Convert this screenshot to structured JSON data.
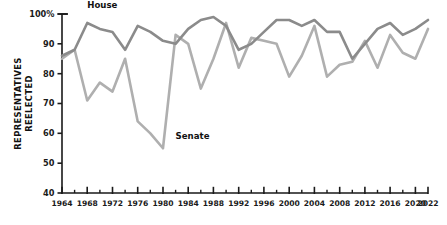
{
  "chart_data": {
    "type": "line",
    "title": "",
    "xlabel": "",
    "ylabel": "REPRESENTATIVES REELECTED",
    "ylabel_lines": [
      "REPRESENTATIVES",
      "REELECTED"
    ],
    "xlim": [
      1964,
      2022
    ],
    "ylim": [
      40,
      100
    ],
    "grid": false,
    "legend": "inline-labels",
    "y_ticks": [
      40,
      50,
      60,
      70,
      80,
      90,
      100
    ],
    "y_ticklabels": [
      "40",
      "50",
      "60",
      "70",
      "80",
      "90",
      "100%"
    ],
    "x_ticks": [
      1964,
      1968,
      1972,
      1976,
      1980,
      1984,
      1988,
      1992,
      1996,
      2000,
      2004,
      2008,
      2012,
      2016,
      2020,
      2022
    ],
    "x_ticklabels": [
      "1964",
      "1968",
      "1972",
      "1976",
      "1980",
      "1984",
      "1988",
      "1992",
      "1996",
      "2000",
      "2004",
      "2008",
      "2012",
      "2016",
      "2020",
      "2022"
    ],
    "x_minor_ticks": [
      1966,
      1970,
      1974,
      1978,
      1982,
      1986,
      1990,
      1994,
      1998,
      2002,
      2006,
      2010,
      2014,
      2018
    ],
    "x": [
      1964,
      1966,
      1968,
      1970,
      1972,
      1974,
      1976,
      1978,
      1980,
      1982,
      1984,
      1986,
      1988,
      1990,
      1992,
      1994,
      1996,
      1998,
      2000,
      2002,
      2004,
      2006,
      2008,
      2010,
      2012,
      2014,
      2016,
      2018,
      2020,
      2022
    ],
    "series": [
      {
        "name": "House",
        "color": "#8b8b8b",
        "label_x": 1968,
        "label_y": 102,
        "values": [
          86,
          88,
          97,
          95,
          94,
          88,
          96,
          94,
          91,
          90,
          95,
          98,
          99,
          96,
          88,
          90,
          94,
          98,
          98,
          96,
          98,
          94,
          94,
          85,
          90,
          95,
          97,
          93,
          95,
          98
        ]
      },
      {
        "name": "Senate",
        "color": "#afafaf",
        "label_x": 1982,
        "label_y": 58,
        "values": [
          85,
          88,
          71,
          77,
          74,
          85,
          64,
          60,
          55,
          93,
          90,
          75,
          85,
          97,
          82,
          92,
          91,
          90,
          79,
          86,
          96,
          79,
          83,
          84,
          91,
          82,
          93,
          87,
          85,
          95
        ]
      }
    ]
  },
  "axis": {
    "y_title_line1": "REPRESENTATIVES",
    "y_title_line2": "REELECTED"
  }
}
